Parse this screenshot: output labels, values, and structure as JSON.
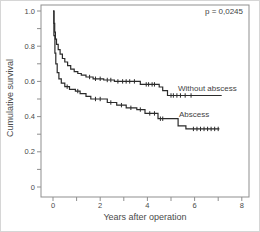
{
  "figure": {
    "p_value": "p = 0,0245",
    "x_axis_title": "Years after operation",
    "y_axis_title": "Cumulative survival"
  },
  "chart_data": {
    "type": "line",
    "subtype": "kaplan-meier-step",
    "title": "",
    "xlabel": "Years after operation",
    "ylabel": "Cumulative survival",
    "xlim": [
      0,
      8
    ],
    "ylim": [
      0,
      1.0
    ],
    "grid": "off",
    "legend_position": "inline-labels-right",
    "p_value_annotation": "p = 0,0245",
    "axes": {
      "x_major": [
        0,
        2,
        4,
        6,
        8
      ],
      "x_major_labels": [
        "0",
        "2",
        "4",
        "6",
        "8"
      ],
      "x_minor": [
        1,
        3,
        5,
        7
      ],
      "y_major": [
        1.0,
        0.8,
        0.6,
        0.4,
        0.2,
        0
      ],
      "y_major_labels": [
        "1.0",
        "0.8",
        "0.6",
        "0.4",
        "0.2",
        "0"
      ],
      "y_minor": [
        0.9,
        0.7,
        0.5,
        0.3,
        0.1
      ]
    },
    "series": [
      {
        "name": "Without abscess",
        "points": [
          [
            0,
            1.0
          ],
          [
            0.04,
            0.93
          ],
          [
            0.07,
            0.88
          ],
          [
            0.1,
            0.84
          ],
          [
            0.15,
            0.81
          ],
          [
            0.22,
            0.78
          ],
          [
            0.3,
            0.755
          ],
          [
            0.4,
            0.73
          ],
          [
            0.5,
            0.71
          ],
          [
            0.62,
            0.69
          ],
          [
            0.75,
            0.67
          ],
          [
            0.9,
            0.655
          ],
          [
            1.05,
            0.645
          ],
          [
            1.2,
            0.635
          ],
          [
            1.4,
            0.625
          ],
          [
            1.7,
            0.615
          ],
          [
            2.15,
            0.608
          ],
          [
            2.6,
            0.6
          ],
          [
            3.7,
            0.583
          ],
          [
            4.5,
            0.568
          ],
          [
            4.65,
            0.548
          ],
          [
            4.85,
            0.52
          ],
          [
            7.15,
            0.52
          ]
        ],
        "censor_times": [
          1.55,
          1.8,
          2.0,
          2.3,
          2.45,
          2.75,
          2.95,
          3.1,
          3.25,
          3.45,
          3.95,
          4.05,
          4.2,
          4.3,
          5.0,
          5.1,
          5.25,
          5.4,
          5.6,
          5.85
        ]
      },
      {
        "name": "Abscess",
        "points": [
          [
            0,
            1.0
          ],
          [
            0.04,
            0.86
          ],
          [
            0.08,
            0.76
          ],
          [
            0.12,
            0.7
          ],
          [
            0.18,
            0.65
          ],
          [
            0.25,
            0.615
          ],
          [
            0.35,
            0.59
          ],
          [
            0.5,
            0.57
          ],
          [
            0.7,
            0.555
          ],
          [
            0.95,
            0.545
          ],
          [
            1.15,
            0.53
          ],
          [
            1.4,
            0.515
          ],
          [
            1.6,
            0.5
          ],
          [
            2.3,
            0.48
          ],
          [
            2.7,
            0.465
          ],
          [
            3.1,
            0.45
          ],
          [
            3.55,
            0.44
          ],
          [
            3.9,
            0.418
          ],
          [
            4.45,
            0.388
          ],
          [
            5.3,
            0.348
          ],
          [
            5.63,
            0.33
          ],
          [
            7.05,
            0.33
          ]
        ],
        "censor_times": [
          0.6,
          1.05,
          1.8,
          2.0,
          2.45,
          2.9,
          3.3,
          3.7,
          4.1,
          4.3,
          4.55,
          4.65,
          5.95,
          6.1,
          6.25,
          6.4,
          6.55,
          6.7,
          6.85,
          7.0
        ]
      }
    ],
    "colors": {
      "line": "#2b2b2b",
      "frame": "#8f8f8f",
      "tick_text": "#4a4a4a",
      "background": "#ffffff"
    },
    "layout": {
      "frame": [
        40,
        4,
        208,
        192
      ],
      "x0": 52,
      "x_scale": 23.6,
      "y0": 186,
      "y_scale": 176,
      "tick_len": 4
    }
  }
}
